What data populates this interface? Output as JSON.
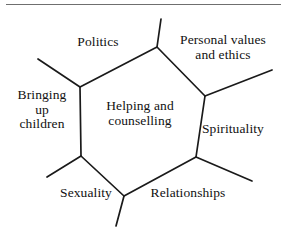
{
  "figure": {
    "name": "helping-and-counselling-hexagon-diagram",
    "type": "cell-diagram",
    "top_rule": true,
    "line_color": "#1a1a1a",
    "rule_color": "#6f6f6f",
    "background": "#ffffff"
  },
  "center": {
    "label": "Helping and\ncounselling"
  },
  "cells": [
    {
      "id": "politics",
      "label": "Politics"
    },
    {
      "id": "personal",
      "label": "Personal values\nand ethics"
    },
    {
      "id": "bringing",
      "label": "Bringing\nup\nchildren"
    },
    {
      "id": "spirituality",
      "label": "Spirituality"
    },
    {
      "id": "sexuality",
      "label": "Sexuality"
    },
    {
      "id": "relationships",
      "label": "Relationships"
    }
  ],
  "geometry": {
    "hexagon_vertices": [
      [
        157,
        47
      ],
      [
        205,
        96
      ],
      [
        196,
        157
      ],
      [
        124,
        196
      ],
      [
        81,
        156
      ],
      [
        80,
        87
      ]
    ],
    "spurs": [
      {
        "from": [
          157,
          47
        ],
        "to": [
          161,
          19
        ]
      },
      {
        "from": [
          205,
          96
        ],
        "to": [
          272,
          70
        ]
      },
      {
        "from": [
          196,
          157
        ],
        "to": [
          252,
          181
        ]
      },
      {
        "from": [
          124,
          196
        ],
        "to": [
          116,
          226
        ]
      },
      {
        "from": [
          81,
          156
        ],
        "to": [
          47,
          177
        ]
      },
      {
        "from": [
          80,
          87
        ],
        "to": [
          38,
          59
        ]
      }
    ]
  }
}
